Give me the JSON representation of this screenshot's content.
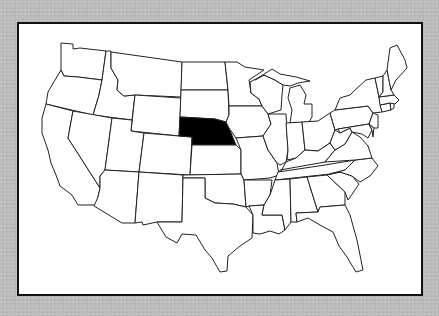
{
  "map": {
    "subject": "United States (contiguous 48 states)",
    "highlighted_state": "Nebraska",
    "highlight_color": "#000000",
    "state_fill": "#ffffff",
    "outline_color": "#222222",
    "frame_border_color": "#111111",
    "background_color": "#bcbcbc"
  }
}
